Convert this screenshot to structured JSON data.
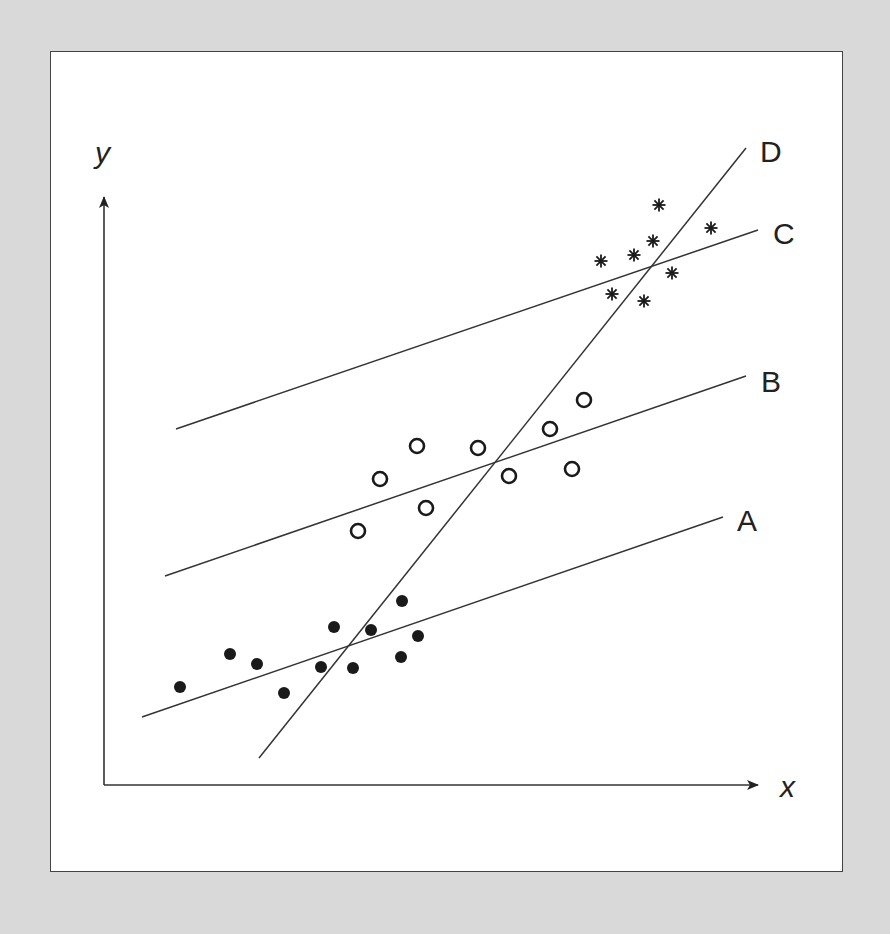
{
  "chart_data": {
    "type": "scatter",
    "title": "",
    "xlabel": "x",
    "ylabel": "y",
    "grid": false,
    "lines": [
      {
        "label": "A",
        "from": [
          142,
          717
        ],
        "to": [
          723,
          517
        ]
      },
      {
        "label": "B",
        "from": [
          165,
          576
        ],
        "to": [
          746,
          376
        ]
      },
      {
        "label": "C",
        "from": [
          176,
          429
        ],
        "to": [
          758,
          230
        ]
      },
      {
        "label": "D",
        "from": [
          259,
          758
        ],
        "to": [
          746,
          148
        ]
      }
    ],
    "series": [
      {
        "name": "group-1",
        "marker": "filled-circle",
        "points": [
          [
            180,
            687
          ],
          [
            230,
            654
          ],
          [
            257,
            664
          ],
          [
            284,
            693
          ],
          [
            321,
            667
          ],
          [
            334,
            627
          ],
          [
            353,
            668
          ],
          [
            371,
            630
          ],
          [
            401,
            657
          ],
          [
            402,
            601
          ],
          [
            418,
            636
          ]
        ]
      },
      {
        "name": "group-2",
        "marker": "open-circle",
        "points": [
          [
            358,
            531
          ],
          [
            380,
            479
          ],
          [
            417,
            446
          ],
          [
            426,
            508
          ],
          [
            478,
            448
          ],
          [
            509,
            476
          ],
          [
            550,
            429
          ],
          [
            572,
            469
          ],
          [
            584,
            400
          ]
        ]
      },
      {
        "name": "group-3",
        "marker": "asterisk",
        "points": [
          [
            601,
            261
          ],
          [
            612,
            294
          ],
          [
            634,
            255
          ],
          [
            644,
            301
          ],
          [
            653,
            241
          ],
          [
            659,
            205
          ],
          [
            672,
            273
          ],
          [
            711,
            228
          ]
        ]
      }
    ]
  },
  "labels": {
    "x_axis": "x",
    "y_axis": "y",
    "line_a": "A",
    "line_b": "B",
    "line_c": "C",
    "line_d": "D"
  }
}
